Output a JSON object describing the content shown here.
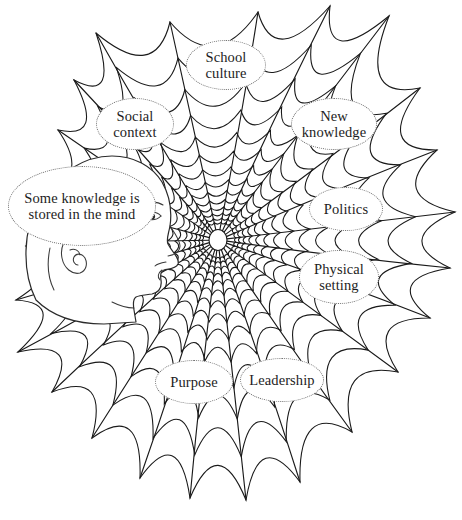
{
  "diagram": {
    "background_color": "#ffffff",
    "line_color": "#1a1a1a",
    "label_border_color": "#6b6b6b",
    "center": {
      "x": 218,
      "y": 240
    }
  },
  "figure": {
    "name": "human head profile"
  },
  "labels": [
    {
      "id": "school-culture",
      "text": "School culture",
      "lines": [
        "School",
        "culture"
      ]
    },
    {
      "id": "social-context",
      "text": "Social context",
      "lines": [
        "Social",
        "context"
      ]
    },
    {
      "id": "new-knowledge",
      "text": "New knowledge",
      "lines": [
        "New",
        "knowledge"
      ]
    },
    {
      "id": "some-knowledge",
      "text": "Some knowledge is stored in the mind",
      "lines": [
        "Some knowledge",
        "is stored in the",
        "mind"
      ]
    },
    {
      "id": "politics",
      "text": "Politics",
      "lines": [
        "Politics"
      ]
    },
    {
      "id": "physical-setting",
      "text": "Physical setting",
      "lines": [
        "Physical",
        "setting"
      ]
    },
    {
      "id": "purpose",
      "text": "Purpose",
      "lines": [
        "Purpose"
      ]
    },
    {
      "id": "leadership",
      "text": "Leadership",
      "lines": [
        "Leadership"
      ]
    }
  ]
}
